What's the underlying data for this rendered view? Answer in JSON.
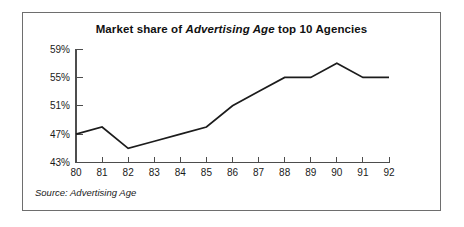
{
  "figure": {
    "title_prefix": "Market share of ",
    "title_emphasis": "Advertising Age",
    "title_suffix": " top 10 Agencies",
    "source_note": "Source: Advertising Age",
    "frame_color": "#6e6e6e",
    "line_color": "#1c1c1c",
    "background": "#ffffff"
  },
  "chart_data": {
    "type": "line",
    "title": "Market share of Advertising Age top 10 Agencies",
    "xlabel": "",
    "ylabel": "",
    "categories": [
      "80",
      "81",
      "82",
      "83",
      "84",
      "85",
      "86",
      "87",
      "88",
      "89",
      "90",
      "91",
      "92"
    ],
    "values": [
      47,
      48,
      45,
      46,
      47,
      48,
      51,
      53,
      55,
      55,
      57,
      55,
      55
    ],
    "ylim": [
      43,
      59
    ],
    "yticks": [
      43,
      47,
      51,
      55,
      59
    ],
    "ytick_labels": [
      "43%",
      "47%",
      "51%",
      "55%",
      "59%"
    ],
    "xtick_labels": [
      "80",
      "81",
      "82",
      "83",
      "84",
      "85",
      "86",
      "87",
      "88",
      "89",
      "90",
      "91",
      "92"
    ],
    "grid": false,
    "legend": null,
    "series": [
      {
        "name": "Market share of Advertising Age top 10 Agencies",
        "values": [
          47,
          48,
          45,
          46,
          47,
          48,
          51,
          53,
          55,
          55,
          57,
          55,
          55
        ]
      }
    ]
  },
  "geometry": {
    "plot_left": 75,
    "plot_right": 388,
    "plot_top": 48,
    "plot_bottom": 161.5
  }
}
